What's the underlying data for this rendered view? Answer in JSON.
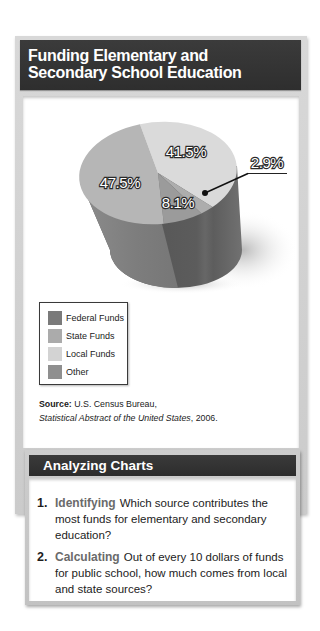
{
  "header": {
    "title_lines": [
      "Funding Elementary and",
      "Secondary School Education"
    ]
  },
  "chart_data": {
    "type": "pie",
    "title": "Funding Elementary and Secondary School Education",
    "style": "3d-cylinder",
    "categories": [
      "Federal Funds",
      "State Funds",
      "Local Funds",
      "Other"
    ],
    "values": [
      8.1,
      47.5,
      41.5,
      2.9
    ],
    "labels": [
      "8.1%",
      "47.5%",
      "41.5%",
      "2.9%"
    ],
    "unit": "%",
    "colors": [
      "#7a7a7a",
      "#ababab",
      "#d3d3d3",
      "#8f8f8f"
    ],
    "face_colors": [
      "#9b9b9b",
      "#b6b6b6",
      "#dadada",
      "#adadad"
    ],
    "legend_position": "bottom-left",
    "grid": false
  },
  "source": {
    "label": "Source:",
    "line1": "U.S. Census Bureau,",
    "publication": "Statistical Abstract of the United States",
    "year_suffix": ", 2006."
  },
  "analyzing": {
    "title": "Analyzing Charts",
    "questions": [
      {
        "number": "1.",
        "skill": "Identifying",
        "text": "Which source contributes the most funds for elementary and secondary education?"
      },
      {
        "number": "2.",
        "skill": "Calculating",
        "text": "Out of every 10 dollars of funds for public school, how much comes from local and state sources?"
      }
    ]
  }
}
